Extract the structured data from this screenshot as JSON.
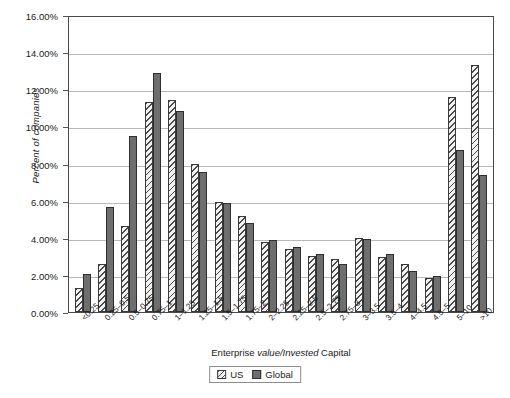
{
  "chart_data": {
    "type": "bar",
    "title": "",
    "xlabel": "Enterprise value/Invested Capital",
    "ylabel": "Percent of companies",
    "ylim": [
      0,
      16
    ],
    "ytick_step": 2,
    "grid": true,
    "legend_position": "bottom-center",
    "ytick_labels": [
      "16.00%",
      "14.00%",
      "12.00%",
      "10.00%",
      "8.00%",
      "6.00%",
      "4.00%",
      "2.00%",
      "0.00%"
    ],
    "yticks": [
      16,
      14,
      12,
      10,
      8,
      6,
      4,
      2,
      0
    ],
    "categories": [
      "<0.25",
      "0.25–0.5",
      "0.5–0.75",
      "0.75–1",
      "1–1.25",
      "1.25–1.5",
      "1.5–1.75",
      "1.75–2",
      "2–2.25",
      "2.25–2.5",
      "2.5–2.75",
      "2.75–3",
      "3–3.5",
      "3.5–4",
      "4–4.5",
      "4.5–5",
      "5–10",
      ">10"
    ],
    "series": [
      {
        "name": "US",
        "color": "#f2f2f2",
        "pattern": "diagonal-hatch",
        "values": [
          1.3,
          2.6,
          4.65,
          11.3,
          11.4,
          7.95,
          5.9,
          5.15,
          3.75,
          3.4,
          3.0,
          2.85,
          4.0,
          2.95,
          2.6,
          1.85,
          11.6,
          13.3
        ]
      },
      {
        "name": "Global",
        "color": "#6e6e6e",
        "pattern": "solid",
        "values": [
          2.05,
          5.65,
          9.5,
          12.9,
          10.85,
          7.55,
          5.85,
          4.8,
          3.9,
          3.5,
          3.1,
          2.6,
          3.95,
          3.15,
          2.2,
          1.95,
          8.75,
          7.4
        ]
      }
    ]
  },
  "axis": {
    "x_title_prefix": "Enterprise ",
    "x_title_italic": "value/Invested",
    "x_title_suffix": " Capital",
    "y_title": "Percent of companies"
  },
  "legend": {
    "items": [
      {
        "label": "US"
      },
      {
        "label": "Global"
      }
    ]
  }
}
